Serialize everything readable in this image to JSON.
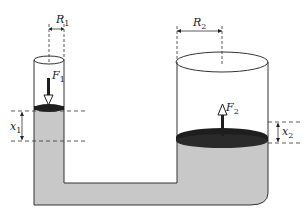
{
  "diagram": {
    "colors": {
      "fluid": "#c8c8c8",
      "piston": "#1e1e1e",
      "outline": "#333333",
      "background": "#ffffff"
    },
    "labels": {
      "r1": {
        "main": "R",
        "sub": "1"
      },
      "r2": {
        "main": "R",
        "sub": "2"
      },
      "f1": {
        "main": "F",
        "sub": "1"
      },
      "f2": {
        "main": "F",
        "sub": "2"
      },
      "x1": {
        "main": "x",
        "sub": "1"
      },
      "x2": {
        "main": "x",
        "sub": "2"
      }
    },
    "components": [
      "small-cylinder",
      "large-cylinder",
      "connecting-pipe",
      "small-piston",
      "large-piston",
      "force-arrow-f1-down",
      "force-arrow-f2-up",
      "radius-dimension-r1",
      "radius-dimension-r2",
      "displacement-dimension-x1",
      "displacement-dimension-x2"
    ]
  }
}
